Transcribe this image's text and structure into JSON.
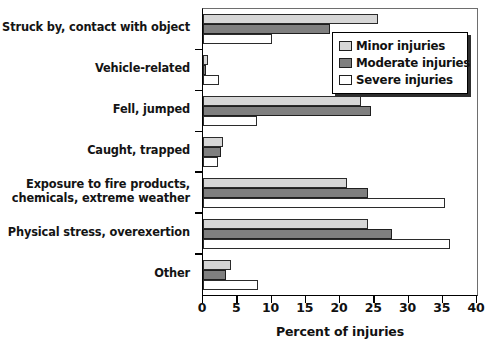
{
  "chart_data": {
    "type": "bar",
    "orientation": "horizontal",
    "title": "",
    "xlabel": "Percent of injuries",
    "ylabel": "",
    "xlim": [
      0,
      40
    ],
    "xticks": [
      0,
      5,
      10,
      15,
      20,
      25,
      30,
      35,
      40
    ],
    "grid": false,
    "legend_position": "top-right",
    "categories": [
      "Struck by, contact with object",
      "Vehicle-related",
      "Fell, jumped",
      "Caught, trapped",
      "Exposure to fire products,\nchemicals, extreme weather",
      "Physical stress, overexertion",
      "Other"
    ],
    "series": [
      {
        "name": "Minor injuries",
        "color": "#d6d6d6",
        "values": [
          25.5,
          0.6,
          23.0,
          2.9,
          21.0,
          24.0,
          4.0
        ]
      },
      {
        "name": "Moderate injuries",
        "color": "#7f7f7f",
        "values": [
          18.5,
          0.4,
          24.5,
          2.6,
          24.0,
          27.5,
          3.3
        ]
      },
      {
        "name": "Severe injuries",
        "color": "#ffffff",
        "values": [
          10.0,
          2.3,
          7.8,
          2.2,
          35.2,
          36.0,
          8.0
        ]
      }
    ]
  },
  "legend": {
    "items": [
      {
        "label": "Minor injuries"
      },
      {
        "label": "Moderate injuries"
      },
      {
        "label": "Severe injuries"
      }
    ]
  },
  "axis": {
    "x_title": "Percent of injuries",
    "tick_labels": [
      "0",
      "5",
      "10",
      "15",
      "20",
      "25",
      "30",
      "35",
      "40"
    ]
  }
}
